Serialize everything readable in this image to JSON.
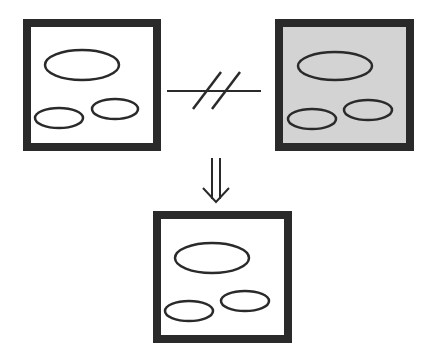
{
  "diagram": {
    "colors": {
      "frame": "#2a2a2a",
      "ellipse_stroke": "#2a2a2a",
      "panel_white": "#ffffff",
      "panel_gray": "#d3d3d3",
      "connector": "#2a2a2a"
    },
    "panels": [
      {
        "id": "left",
        "fill": "white",
        "x": 23,
        "y": 19,
        "w": 138,
        "h": 132
      },
      {
        "id": "right",
        "fill": "gray",
        "x": 275,
        "y": 19,
        "w": 139,
        "h": 132
      },
      {
        "id": "bottom",
        "fill": "white",
        "x": 153,
        "y": 211,
        "w": 139,
        "h": 132
      }
    ],
    "relations": [
      {
        "from": "left",
        "to": "right",
        "symbol": "not-equal (//)"
      },
      {
        "from": "top",
        "to": "bottom",
        "symbol": "double-down-arrow"
      }
    ]
  }
}
